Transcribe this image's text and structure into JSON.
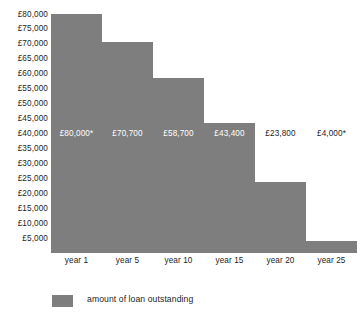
{
  "chart_data": {
    "type": "bar",
    "title": "",
    "subtitle": "",
    "xlabel": "",
    "ylabel": "",
    "categories": [
      "year 1",
      "year 5",
      "year 10",
      "year 15",
      "year 20",
      "year 25"
    ],
    "values": [
      80000,
      70700,
      58700,
      43400,
      23800,
      4000
    ],
    "value_labels": [
      "£80,000*",
      "£70,700",
      "£58,700",
      "£43,400",
      "£23,800",
      "£4,000*"
    ],
    "ylim": [
      0,
      80000
    ],
    "ytick_labels": [
      "£80,000",
      "£75,000",
      "£70,000",
      "£65,000",
      "£60,000",
      "£55,000",
      "£50,000",
      "£45,000",
      "£40,000",
      "£35,000",
      "£30,000",
      "£25,000",
      "£20,000",
      "£15,000",
      "£10,000",
      "£5,000"
    ],
    "ytick_values": [
      80000,
      75000,
      70000,
      65000,
      60000,
      55000,
      50000,
      45000,
      40000,
      35000,
      30000,
      25000,
      20000,
      15000,
      10000,
      5000
    ],
    "grid": false,
    "legend": {
      "position": "bottom-left",
      "entries": [
        {
          "label": "amount of loan outstanding",
          "color": "#7e7e7e",
          "swatch": "legend-swatch-loan"
        }
      ]
    },
    "series": [
      {
        "name": "amount of loan outstanding",
        "color": "#7e7e7e",
        "values": [
          80000,
          70700,
          58700,
          43400,
          23800,
          4000
        ]
      }
    ],
    "colors": {
      "bar": "#7e7e7e",
      "text": "#1d1d1d",
      "on_bar_text": "#ffffff",
      "background": "#ffffff"
    }
  }
}
